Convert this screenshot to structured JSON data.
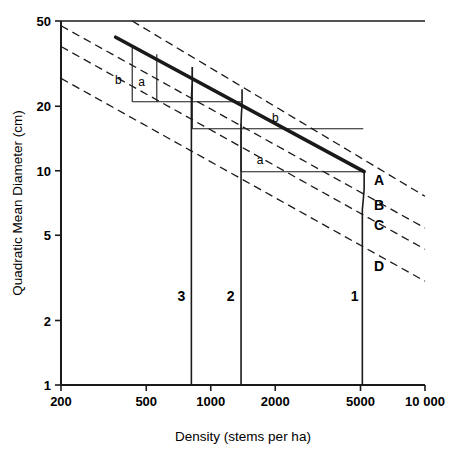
{
  "chart_data": {
    "type": "line",
    "title": "",
    "xlabel": "Density (stems per ha)",
    "ylabel": "Quadratic Mean Diameter (cm)",
    "xscale": "log",
    "yscale": "log",
    "xlim": [
      200,
      10000
    ],
    "ylim": [
      1,
      50
    ],
    "grid": false,
    "legend": "none",
    "xticks": [
      {
        "value": 200,
        "label": "200"
      },
      {
        "value": 500,
        "label": "500"
      },
      {
        "value": 1000,
        "label": "1000"
      },
      {
        "value": 2000,
        "label": "2000"
      },
      {
        "value": 5000,
        "label": "5000"
      },
      {
        "value": 10000,
        "label": "10 000"
      }
    ],
    "yticks": [
      {
        "value": 1,
        "label": "1"
      },
      {
        "value": 2,
        "label": "2"
      },
      {
        "value": 5,
        "label": "5"
      },
      {
        "value": 10,
        "label": "10"
      },
      {
        "value": 20,
        "label": "20"
      },
      {
        "value": 50,
        "label": "50"
      }
    ],
    "series": [
      {
        "name": "A",
        "style": "dashed",
        "label": "A",
        "label_x": 6100,
        "label_y": 9.1,
        "points": [
          [
            430,
            50.0
          ],
          [
            10000,
            7.6
          ]
        ]
      },
      {
        "name": "B",
        "style": "dashed",
        "label": "B",
        "label_x": 6100,
        "label_y": 6.9,
        "points": [
          [
            200,
            47.5
          ],
          [
            10000,
            5.4
          ]
        ]
      },
      {
        "name": "C",
        "style": "dashed",
        "label": "C",
        "label_x": 6100,
        "label_y": 5.6,
        "points": [
          [
            200,
            38.0
          ],
          [
            10000,
            4.3
          ]
        ]
      },
      {
        "name": "D",
        "style": "dashed",
        "label": "D",
        "label_x": 6100,
        "label_y": 3.6,
        "points": [
          [
            200,
            27.0
          ],
          [
            10000,
            3.05
          ]
        ]
      },
      {
        "name": "self-thinning-boundary",
        "style": "thick-solid",
        "label": "",
        "points": [
          [
            360,
            42.0
          ],
          [
            5200,
            9.9
          ]
        ]
      },
      {
        "name": "regime-1",
        "style": "solid",
        "label": "1",
        "label_x": 4700,
        "label_y": 2.6,
        "points": [
          [
            5200,
            9.9
          ],
          [
            5200,
            8.2
          ],
          [
            5150,
            7.3
          ],
          [
            5100,
            6.6
          ],
          [
            5100,
            1.0
          ]
        ]
      },
      {
        "name": "regime-2",
        "style": "solid",
        "label": "2",
        "label_x": 1240,
        "label_y": 2.6,
        "points": [
          [
            1400,
            24.0
          ],
          [
            1400,
            20.5
          ],
          [
            1390,
            18.3
          ],
          [
            1385,
            16.6
          ],
          [
            1385,
            1.0
          ]
        ]
      },
      {
        "name": "regime-3",
        "style": "solid",
        "label": "3",
        "label_x": 730,
        "label_y": 2.6,
        "points": [
          [
            820,
            30.5
          ],
          [
            820,
            26.0
          ],
          [
            815,
            23.3
          ],
          [
            812,
            21.0
          ],
          [
            812,
            1.0
          ]
        ]
      }
    ],
    "connector_segments": [
      {
        "name": "top-left-riser-b",
        "x": 430,
        "y0": 21.0,
        "y1": 37.5
      },
      {
        "name": "top-left-riser-a",
        "x": 560,
        "y0": 21.0,
        "y1": 35.0
      },
      {
        "name": "upper-horizontal",
        "y": 21.0,
        "x0": 430,
        "x1": 1400
      },
      {
        "name": "mid-riser",
        "x": 820,
        "y0": 15.7,
        "y1": 30.5
      },
      {
        "name": "mid-horizontal-b",
        "y": 15.7,
        "x0": 820,
        "x1": 5150
      },
      {
        "name": "low-riser",
        "x": 1385,
        "y0": 9.9,
        "y1": 16.6
      },
      {
        "name": "low-horizontal-a",
        "y": 9.9,
        "x0": 1385,
        "x1": 5150
      }
    ],
    "zone_labels": [
      {
        "name": "zone-b-upper-left",
        "text": "b",
        "x": 370,
        "y": 26.5
      },
      {
        "name": "zone-a-upper-left",
        "text": "a",
        "x": 475,
        "y": 26.0
      },
      {
        "name": "zone-b-middle",
        "text": "b",
        "x": 2000,
        "y": 17.6
      },
      {
        "name": "zone-a-lower",
        "text": "a",
        "x": 1700,
        "y": 11.2
      }
    ]
  }
}
